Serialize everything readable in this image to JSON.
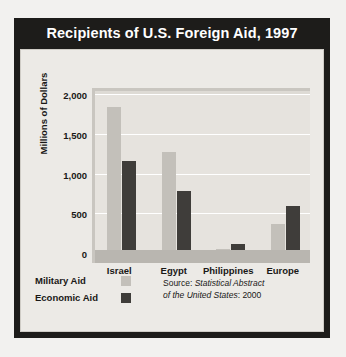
{
  "chart_data": {
    "type": "bar",
    "title": "Recipients of U.S. Foreign Aid, 1997",
    "xlabel": "",
    "ylabel": "Millions of Dollars",
    "categories": [
      "Israel",
      "Egypt",
      "Philippines",
      "Europe"
    ],
    "series": [
      {
        "name": "Military Aid",
        "color": "#c3c0ba",
        "values": [
          1800,
          1230,
          5,
          330
        ]
      },
      {
        "name": "Economic Aid",
        "color": "#3f3d3a",
        "values": [
          1120,
          740,
          70,
          550
        ]
      }
    ],
    "ylim": [
      0,
      2000
    ],
    "yticks": [
      0,
      500,
      1000,
      1500,
      2000
    ],
    "ytick_labels": [
      "0",
      "500",
      "1,000",
      "1,500",
      "2,000"
    ],
    "grid": true,
    "legend_position": "bottom-left",
    "source_prefix": "Source: ",
    "source_title": "Statistical Abstract",
    "source_title_line2": "of the United States",
    "source_suffix": ": 2000"
  },
  "legend": {
    "items": [
      {
        "label": "Military Aid",
        "swatch": "military"
      },
      {
        "label": "Economic Aid",
        "swatch": "economic"
      }
    ]
  }
}
